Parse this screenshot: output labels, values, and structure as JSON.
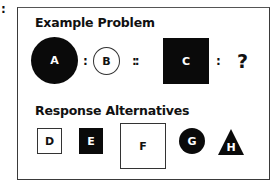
{
  "outer_colon": ":",
  "example": {
    "heading": "Example Problem",
    "items": [
      {
        "label": "A",
        "shape": "circle",
        "size": "large",
        "fill": "black"
      },
      {
        "symbol": ":"
      },
      {
        "label": "B",
        "shape": "circle",
        "size": "small",
        "fill": "white"
      },
      {
        "symbol": "::"
      },
      {
        "label": "C",
        "shape": "square",
        "size": "large",
        "fill": "black"
      },
      {
        "symbol": ":"
      },
      {
        "unknown": "?"
      }
    ]
  },
  "alternatives": {
    "heading": "Response Alternatives",
    "items": [
      {
        "label": "D",
        "shape": "square",
        "size": "small",
        "fill": "white"
      },
      {
        "label": "E",
        "shape": "square",
        "size": "small",
        "fill": "black"
      },
      {
        "label": "F",
        "shape": "square",
        "size": "large",
        "fill": "white"
      },
      {
        "label": "G",
        "shape": "circle",
        "size": "small",
        "fill": "black"
      },
      {
        "label": "H",
        "shape": "triangle",
        "size": "small",
        "fill": "black"
      }
    ]
  },
  "colors": {
    "shape_fill": "#0a0a0a",
    "frame": "#3a3a3a",
    "background": "#ffffff"
  }
}
